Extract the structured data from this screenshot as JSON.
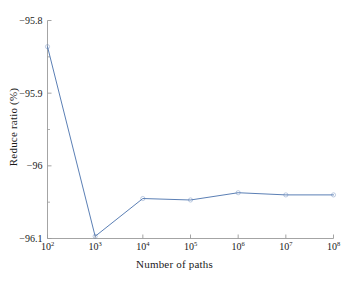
{
  "chart_data": {
    "type": "line",
    "title": "",
    "xlabel": "Number of paths",
    "ylabel": "Reduce ratio (%)",
    "xscale": "log",
    "xlim": [
      100,
      100000000
    ],
    "ylim": [
      -96.1,
      -95.8
    ],
    "grid": false,
    "legend": null,
    "x": [
      100,
      1000,
      10000,
      100000,
      1000000,
      10000000,
      100000000
    ],
    "x_tick_labels": [
      "10²",
      "10³",
      "10⁴",
      "10⁵",
      "10⁶",
      "10⁷",
      "10⁸"
    ],
    "x_tick_bases": [
      "10",
      "10",
      "10",
      "10",
      "10",
      "10",
      "10"
    ],
    "x_tick_exponents": [
      "2",
      "3",
      "4",
      "5",
      "6",
      "7",
      "8"
    ],
    "y_tick_labels": [
      "−95.8",
      "−95.9",
      "−96",
      "−96.1"
    ],
    "y_tick_values": [
      -95.8,
      -95.9,
      -96.0,
      -96.1
    ],
    "y_minor_tick_values": [
      -95.85,
      -95.95,
      -96.05
    ],
    "series": [
      {
        "name": "Reduce ratio",
        "color": "#5b7fb5",
        "marker": "circle",
        "values": [
          -95.836,
          -96.097,
          -96.045,
          -96.047,
          -96.037,
          -96.04,
          -96.04
        ]
      }
    ]
  },
  "figure": {
    "axis_color": "#9a9a9a",
    "text_color": "#1a1a1a",
    "background": "#ffffff"
  }
}
